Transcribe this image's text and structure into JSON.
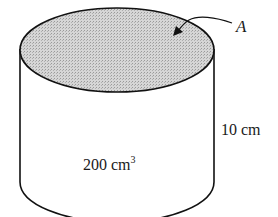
{
  "diagram": {
    "shape": "cylinder",
    "top_face_label": "A",
    "height_label": "10 cm",
    "volume_label": "200 cm",
    "volume_exponent": "3",
    "colors": {
      "stroke": "#111111",
      "top_fill": "#c9c9c9",
      "background": "#ffffff"
    }
  }
}
